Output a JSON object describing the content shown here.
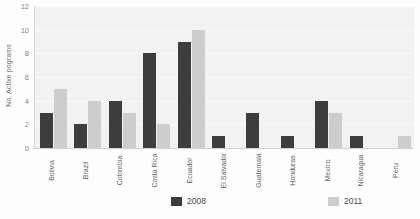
{
  "chart_data": {
    "type": "bar",
    "title": "",
    "subtitle": "",
    "xlabel": "",
    "ylabel": "No. Active pograms",
    "ylim": [
      0,
      12
    ],
    "yticks": [
      0,
      2,
      4,
      6,
      8,
      10,
      12
    ],
    "grid": true,
    "legend_position": "bottom",
    "categories": [
      "Bolivia",
      "Brazil",
      "Colombia",
      "Costa Rica",
      "Ecuador",
      "El Salvador",
      "Guatemala",
      "Honduras",
      "Mexico",
      "Nicaragua",
      "Peru"
    ],
    "series": [
      {
        "name": "2008",
        "color": "#3d3d3d",
        "values": [
          3,
          2,
          4,
          8,
          9,
          1,
          3,
          1,
          4,
          1,
          0
        ]
      },
      {
        "name": "2011",
        "color": "#cdcdcd",
        "values": [
          5,
          4,
          3,
          2,
          10,
          0,
          0,
          0,
          3,
          0,
          1
        ]
      }
    ]
  },
  "legend": {
    "entries": [
      {
        "label": "2008",
        "color": "#3d3d3d"
      },
      {
        "label": "2011",
        "color": "#cdcdcd"
      }
    ]
  },
  "colors": {
    "series_2008": "#3d3d3d",
    "series_2011": "#cdcdcd",
    "plot_background": "#f2f2f2",
    "gridline": "#fbfbfb",
    "axis": "#cfcfcf",
    "tick_text": "#858585",
    "label_text": "#636363"
  }
}
